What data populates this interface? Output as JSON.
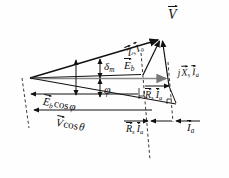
{
  "figure": {
    "type": "phasor-diagram",
    "background_color": "#fefefe",
    "line_color": "#111111",
    "axis_color": "#8a8a8a"
  },
  "labels": {
    "terminal_voltage": {
      "symbol": "V",
      "sub": "",
      "vector": true
    },
    "impedance_drop": {
      "symbol": "Z",
      "sub": "s",
      "symbol2": "I",
      "sub2": "a",
      "vector": true
    },
    "back_emf": {
      "symbol": "E",
      "sub": "b",
      "vector": true
    },
    "reactance_drop": {
      "prefix": "j",
      "symbol": "X",
      "sub": "s",
      "symbol2": "I",
      "sub2": "a",
      "vector": true
    },
    "resistance_drop_upper": {
      "symbol": "R",
      "sub": "s",
      "symbol2": "I",
      "sub2": "a",
      "vector": true
    },
    "resistance_drop_lower": {
      "symbol": "R",
      "sub": "s",
      "symbol2": "I",
      "sub2": "a",
      "vector": true
    },
    "armature_current": {
      "symbol": "I",
      "sub": "a",
      "vector": true
    },
    "torque_angle": {
      "symbol": "δ",
      "sub": "m"
    },
    "power_factor_angle": {
      "symbol": "φ",
      "sub": ""
    },
    "eb_cos_phi": {
      "symbol": "E",
      "sub": "b",
      "fn": "cos",
      "arg": "φ",
      "vector": true
    },
    "v_cos_theta": {
      "symbol": "V",
      "sub": "",
      "fn": "cos",
      "arg": "θ",
      "vector": true
    }
  },
  "geometry": {
    "origin": {
      "x": 30,
      "y": 78
    },
    "apex_V": {
      "x": 161,
      "y": 38
    },
    "point_Eb": {
      "x": 143,
      "y": 75
    },
    "point_right_axis": {
      "x": 169,
      "y": 86
    },
    "lower_right": {
      "x": 156,
      "y": 113
    }
  }
}
